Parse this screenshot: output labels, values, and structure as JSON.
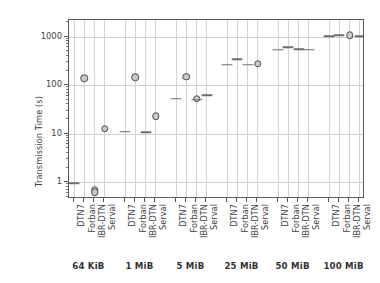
{
  "chart_data": {
    "type": "scatter",
    "title": "",
    "xlabel": "",
    "ylabel": "Transmission Time (s)",
    "yscale": "log",
    "ylim": [
      0.45,
      2200
    ],
    "yticks": [
      1,
      10,
      100,
      1000
    ],
    "ytick_labels": [
      "1",
      "10",
      "100",
      "1000"
    ],
    "grid": "both",
    "legend": "none",
    "protocols": [
      "DTN7",
      "Forban",
      "IBR-DTN",
      "Serval"
    ],
    "groups": [
      "64 KiB",
      "1 MiB",
      "5 MiB",
      "25 MiB",
      "50 MiB",
      "100 MiB"
    ],
    "categories": [
      "DTN7",
      "Forban",
      "IBR-DTN",
      "Serval",
      "DTN7",
      "Forban",
      "IBR-DTN",
      "Serval",
      "DTN7",
      "Forban",
      "IBR-DTN",
      "Serval",
      "DTN7",
      "Forban",
      "IBR-DTN",
      "Serval",
      "DTN7",
      "Forban",
      "IBR-DTN",
      "Serval",
      "DTN7",
      "Forban",
      "IBR-DTN",
      "Serval"
    ],
    "points": [
      {
        "group": "64 KiB",
        "protocol": "DTN7",
        "value": 0.95,
        "marker": "dash"
      },
      {
        "group": "64 KiB",
        "protocol": "Forban",
        "value": 140,
        "marker": "circle"
      },
      {
        "group": "64 KiB",
        "protocol": "IBR-DTN",
        "value": 0.68,
        "marker": "circle"
      },
      {
        "group": "64 KiB",
        "protocol": "IBR-DTN",
        "value": 0.62,
        "marker": "circle"
      },
      {
        "group": "64 KiB",
        "protocol": "Serval",
        "value": 12.5,
        "marker": "circle"
      },
      {
        "group": "1 MiB",
        "protocol": "DTN7",
        "value": 11,
        "marker": "dash"
      },
      {
        "group": "1 MiB",
        "protocol": "Forban",
        "value": 145,
        "marker": "circle"
      },
      {
        "group": "1 MiB",
        "protocol": "IBR-DTN",
        "value": 10.8,
        "marker": "dash"
      },
      {
        "group": "1 MiB",
        "protocol": "Serval",
        "value": 23,
        "marker": "circle"
      },
      {
        "group": "5 MiB",
        "protocol": "DTN7",
        "value": 53,
        "marker": "dash"
      },
      {
        "group": "5 MiB",
        "protocol": "Forban",
        "value": 150,
        "marker": "circle"
      },
      {
        "group": "5 MiB",
        "protocol": "IBR-DTN",
        "value": 52,
        "marker": "circle"
      },
      {
        "group": "5 MiB",
        "protocol": "IBR-DTN",
        "value": 50,
        "marker": "dash"
      },
      {
        "group": "5 MiB",
        "protocol": "Serval",
        "value": 62,
        "marker": "dash"
      },
      {
        "group": "25 MiB",
        "protocol": "DTN7",
        "value": 265,
        "marker": "dash"
      },
      {
        "group": "25 MiB",
        "protocol": "Forban",
        "value": 340,
        "marker": "dash"
      },
      {
        "group": "25 MiB",
        "protocol": "IBR-DTN",
        "value": 265,
        "marker": "dash"
      },
      {
        "group": "25 MiB",
        "protocol": "Serval",
        "value": 275,
        "marker": "circle"
      },
      {
        "group": "50 MiB",
        "protocol": "DTN7",
        "value": 540,
        "marker": "dash"
      },
      {
        "group": "50 MiB",
        "protocol": "Forban",
        "value": 600,
        "marker": "dash"
      },
      {
        "group": "50 MiB",
        "protocol": "IBR-DTN",
        "value": 545,
        "marker": "dash"
      },
      {
        "group": "50 MiB",
        "protocol": "Serval",
        "value": 535,
        "marker": "dash"
      },
      {
        "group": "100 MiB",
        "protocol": "DTN7",
        "value": 1020,
        "marker": "dash"
      },
      {
        "group": "100 MiB",
        "protocol": "Forban",
        "value": 1080,
        "marker": "dash"
      },
      {
        "group": "100 MiB",
        "protocol": "IBR-DTN",
        "value": 1060,
        "marker": "circle"
      },
      {
        "group": "100 MiB",
        "protocol": "Serval",
        "value": 1020,
        "marker": "dash"
      }
    ],
    "colors": {
      "marker_edge": "#4b4b4b",
      "marker_face": "#c9c9c9",
      "dash": "#6d6d6d",
      "grid": "#d3d3d3",
      "axis": "#5a5a5a",
      "text": "#3d3d3d",
      "background": "#ffffff"
    }
  }
}
